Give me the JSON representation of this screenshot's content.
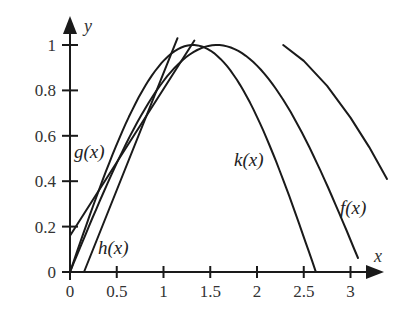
{
  "chart_data": {
    "type": "line",
    "title": "",
    "xlabel": "x",
    "ylabel": "y",
    "xlim": [
      0,
      3.3
    ],
    "ylim": [
      0,
      1.05
    ],
    "grid": false,
    "legend": "none (inline curve labels)",
    "x_ticks": [
      0,
      0.5,
      1,
      1.5,
      2,
      2.5,
      3
    ],
    "x_tick_labels": [
      "0",
      "0.5",
      "1",
      "1.5",
      "2",
      "2.5",
      "3"
    ],
    "y_ticks": [
      0,
      0.2,
      0.4,
      0.6,
      0.8,
      1
    ],
    "y_tick_labels": [
      "0",
      "0.2",
      "0.4",
      "0.6",
      "0.8",
      "1"
    ],
    "series": [
      {
        "name": "f(x)",
        "kind": "curve",
        "x": [
          0,
          0.25,
          0.5,
          0.75,
          1.0,
          1.25,
          1.5,
          1.57,
          1.75,
          2.0,
          2.25,
          2.5,
          2.75,
          3.0,
          3.08
        ],
        "values": [
          0,
          0.25,
          0.48,
          0.68,
          0.84,
          0.95,
          1.0,
          1.0,
          0.98,
          0.91,
          0.78,
          0.6,
          0.38,
          0.14,
          0.0
        ]
      },
      {
        "name": "k(x)",
        "kind": "curve",
        "x": [
          0,
          0.25,
          0.5,
          0.75,
          1.0,
          1.25,
          1.43,
          1.6,
          1.8,
          2.0,
          2.2,
          2.4,
          2.63
        ],
        "values": [
          0,
          0.29,
          0.56,
          0.78,
          0.93,
          0.99,
          1.0,
          0.98,
          0.9,
          0.74,
          0.5,
          0.27,
          0.0
        ]
      },
      {
        "name": "g(x)",
        "kind": "line",
        "x": [
          0,
          1.33
        ],
        "values": [
          0.16,
          1.02
        ]
      },
      {
        "name": "h(x)",
        "kind": "line",
        "x": [
          0.15,
          1.15
        ],
        "values": [
          0,
          1.03
        ]
      },
      {
        "name": "unlabeled",
        "kind": "curve",
        "x": [
          2.28,
          2.5,
          2.75,
          3.0,
          3.2,
          3.39
        ],
        "values": [
          1.0,
          0.93,
          0.82,
          0.68,
          0.55,
          0.41
        ]
      }
    ],
    "annotations": [
      {
        "text": "g(x)",
        "x": 0.05,
        "y": 0.53
      },
      {
        "text": "h(x)",
        "x": 0.3,
        "y": 0.1
      },
      {
        "text": "k(x)",
        "x": 1.75,
        "y": 0.53
      },
      {
        "text": "f(x)",
        "x": 2.9,
        "y": 0.3
      }
    ]
  },
  "labels": {
    "x_axis": "x",
    "y_axis": "y",
    "g": "g(x)",
    "h": "h(x)",
    "k": "k(x)",
    "f": "f(x)"
  }
}
